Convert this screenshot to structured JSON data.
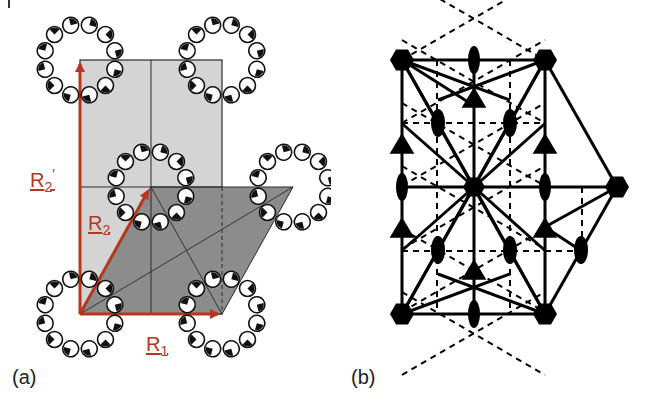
{
  "figure": {
    "panels": [
      {
        "id": "a",
        "label": "(a)",
        "description": "Hexagonal lattice with primitive cell (R1, R2) and rectangular centered cell (R1, R2'), motif rings of 12 half-filled circles at each lattice point",
        "vectors": [
          {
            "name": "R1",
            "text": "R",
            "sub": "1",
            "color": "#b5371f"
          },
          {
            "name": "R2",
            "text": "R",
            "sub": "2",
            "color": "#b5371f"
          },
          {
            "name": "R2prime",
            "text": "R",
            "sub": "2",
            "sup": "′",
            "color": "#b5371f"
          }
        ],
        "colors": {
          "rect_fill": "#d4d4d4",
          "parallelogram_fill": "#8c8c8c",
          "vector": "#b5371f",
          "lines": "#2a2a2a"
        },
        "lattice_points": [
          {
            "x": 80,
            "y": 60
          },
          {
            "x": 222,
            "y": 60
          },
          {
            "x": 151,
            "y": 187
          },
          {
            "x": 293,
            "y": 187
          },
          {
            "x": 80,
            "y": 314
          },
          {
            "x": 222,
            "y": 314
          }
        ]
      },
      {
        "id": "b",
        "label": "(b)",
        "description": "Symmetry elements of plane group p6mm: six-fold rotation (hexagons), three-fold (triangles), two-fold (ellipses), mirror lines (solid) and glide lines (dashed)",
        "symbols": {
          "six_fold": "filled-hexagon",
          "three_fold": "filled-triangle",
          "two_fold": "filled-ellipse",
          "mirror": "solid-line",
          "glide": "dashed-line"
        }
      }
    ]
  }
}
